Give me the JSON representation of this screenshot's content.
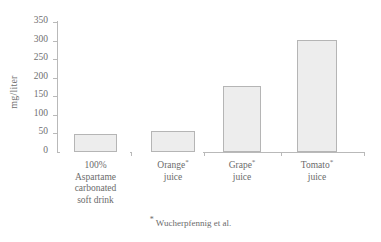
{
  "chart_data": {
    "type": "bar",
    "title": "",
    "xlabel": "",
    "ylabel": "mg/liter",
    "ylim": [
      0,
      350
    ],
    "yticks": [
      0,
      50,
      100,
      150,
      200,
      250,
      300,
      350
    ],
    "ytick_labels": [
      "0",
      "50",
      "100",
      "150",
      "200",
      "250",
      "300",
      "350"
    ],
    "grid": false,
    "legend": "none",
    "categories": [
      "100% Aspartame carbonated soft drink",
      "Orange* juice",
      "Grape* juice",
      "Tomato* juice"
    ],
    "category_lines": [
      [
        "100%",
        "Aspartame",
        "carbonated",
        "soft drink"
      ],
      [
        "Orange*",
        "juice"
      ],
      [
        "Grape*",
        "juice"
      ],
      [
        "Tomato*",
        "juice"
      ]
    ],
    "values": [
      48,
      57,
      178,
      302
    ],
    "bar_fill_color": "#ededed",
    "bar_border_color": "#b5b5b5",
    "axis_color": "#b9b9b9",
    "text_color": "#6b6b6b",
    "annotations": [
      "* Wucherpfennig et al."
    ]
  },
  "yaxis": {
    "title": "mg/liter",
    "ticks": [
      {
        "label": "350",
        "value": 350
      },
      {
        "label": "300",
        "value": 300
      },
      {
        "label": "250",
        "value": 250
      },
      {
        "label": "200",
        "value": 200
      },
      {
        "label": "150",
        "value": 150
      },
      {
        "label": "100",
        "value": 100
      },
      {
        "label": "50",
        "value": 50
      },
      {
        "label": "0",
        "value": 0
      }
    ]
  },
  "categories": [
    {
      "lines": [
        "100%",
        "Aspartame",
        "carbonated",
        "soft drink"
      ],
      "starred": false
    },
    {
      "lines": [
        "Orange",
        "juice"
      ],
      "starred": true
    },
    {
      "lines": [
        "Grape",
        "juice"
      ],
      "starred": true
    },
    {
      "lines": [
        "Tomato",
        "juice"
      ],
      "starred": true
    }
  ],
  "footnote": {
    "marker": "*",
    "text": " Wucherpfennig et al."
  }
}
